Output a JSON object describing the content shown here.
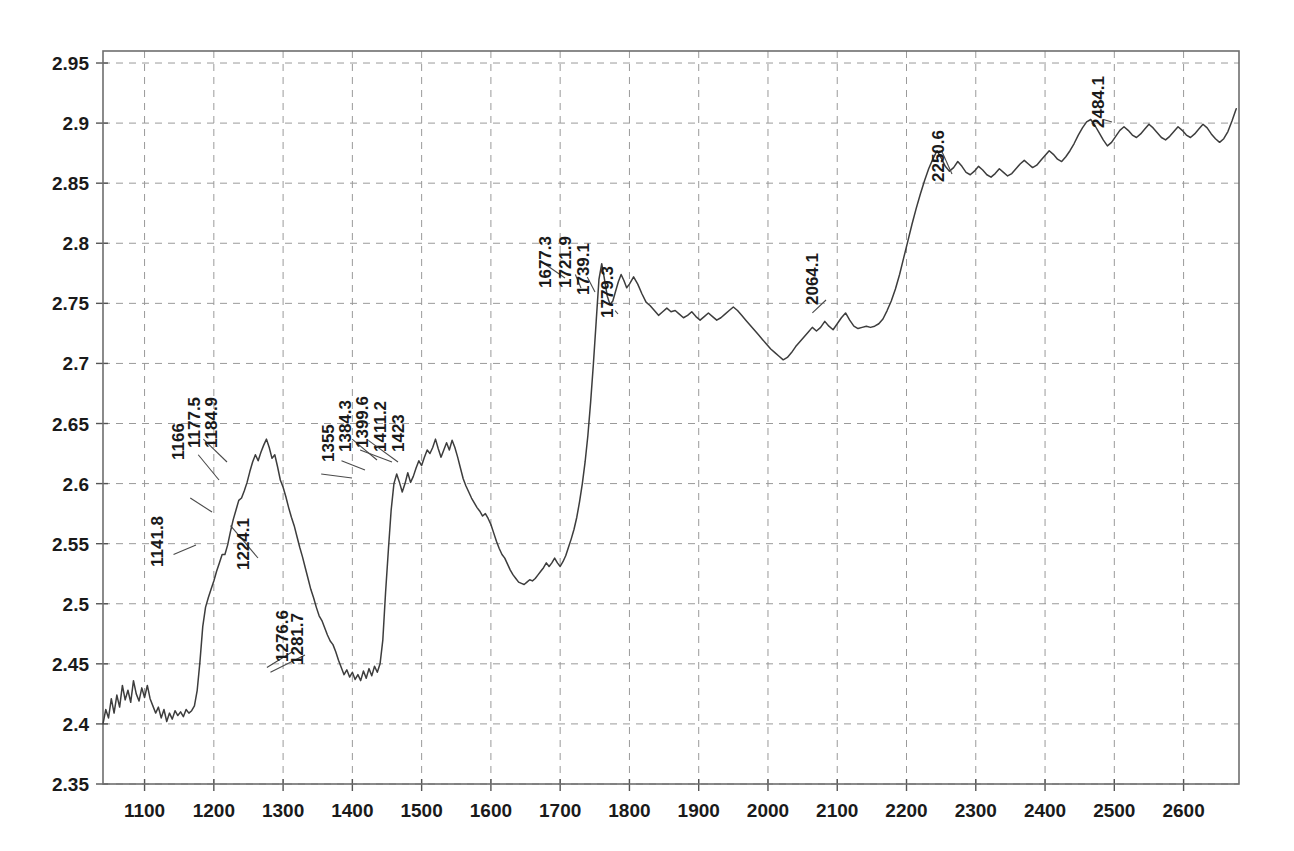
{
  "chart_data": {
    "type": "line",
    "title": "",
    "xlabel": "",
    "ylabel": "",
    "xlim": [
      1040,
      2680
    ],
    "ylim": [
      2.35,
      2.96
    ],
    "grid": true,
    "legend": null,
    "x_ticks": [
      1100,
      1200,
      1300,
      1400,
      1500,
      1600,
      1700,
      1800,
      1900,
      2000,
      2100,
      2200,
      2300,
      2400,
      2500,
      2600
    ],
    "y_ticks": [
      2.35,
      2.4,
      2.45,
      2.5,
      2.55,
      2.6,
      2.65,
      2.7,
      2.75,
      2.8,
      2.85,
      2.9,
      2.95
    ],
    "x_tick_labels": [
      "1100",
      "1200",
      "1300",
      "1400",
      "1500",
      "1600",
      "1700",
      "1800",
      "1900",
      "2000",
      "2100",
      "2200",
      "2300",
      "2400",
      "2500",
      "2600"
    ],
    "y_tick_labels": [
      "2.35",
      "2.4",
      "2.45",
      "2.5",
      "2.55",
      "2.6",
      "2.65",
      "2.7",
      "2.75",
      "2.8",
      "2.85",
      "2.9",
      "2.95"
    ],
    "line_color": "#3d3d3d",
    "grid_color": "#9a9a9a",
    "annotations": [
      {
        "label": "1141.8",
        "x": 1141.8,
        "y": 2.541
      },
      {
        "label": "1166",
        "x": 1166.0,
        "y": 2.588
      },
      {
        "label": "1177.5",
        "x": 1177.5,
        "y": 2.624
      },
      {
        "label": "1184.9",
        "x": 1184.9,
        "y": 2.637
      },
      {
        "label": "1224.1",
        "x": 1224.1,
        "y": 2.565
      },
      {
        "label": "1276.6",
        "x": 1276.6,
        "y": 2.447
      },
      {
        "label": "1281.7",
        "x": 1281.7,
        "y": 2.443
      },
      {
        "label": "1355",
        "x": 1355.0,
        "y": 2.608
      },
      {
        "label": "1384.3",
        "x": 1384.3,
        "y": 2.619
      },
      {
        "label": "1399.6",
        "x": 1399.6,
        "y": 2.637
      },
      {
        "label": "1411.2",
        "x": 1411.2,
        "y": 2.628
      },
      {
        "label": "1423",
        "x": 1423.0,
        "y": 2.636
      },
      {
        "label": "1677.3",
        "x": 1677.3,
        "y": 2.783
      },
      {
        "label": "1721.9",
        "x": 1721.9,
        "y": 2.774
      },
      {
        "label": "1739.1",
        "x": 1739.1,
        "y": 2.772
      },
      {
        "label": "1779.3",
        "x": 1779.3,
        "y": 2.744
      },
      {
        "label": "2064.1",
        "x": 2064.1,
        "y": 2.742
      },
      {
        "label": "2250.6",
        "x": 2250.6,
        "y": 2.877
      },
      {
        "label": "2484.1",
        "x": 2484.1,
        "y": 2.903
      }
    ],
    "x": [
      1040,
      1044,
      1048,
      1052,
      1056,
      1060,
      1064,
      1068,
      1072,
      1076,
      1080,
      1084,
      1088,
      1092,
      1096,
      1100,
      1104,
      1108,
      1112,
      1116,
      1120,
      1124,
      1128,
      1132,
      1136,
      1140,
      1144,
      1148,
      1152,
      1156,
      1160,
      1164,
      1168,
      1172,
      1176,
      1180,
      1184,
      1188,
      1192,
      1196,
      1200,
      1204,
      1208,
      1212,
      1216,
      1220,
      1224,
      1228,
      1232,
      1236,
      1240,
      1244,
      1248,
      1252,
      1256,
      1260,
      1264,
      1268,
      1272,
      1276,
      1280,
      1284,
      1288,
      1292,
      1296,
      1300,
      1304,
      1308,
      1312,
      1316,
      1320,
      1324,
      1328,
      1332,
      1336,
      1340,
      1344,
      1348,
      1352,
      1356,
      1360,
      1364,
      1368,
      1372,
      1376,
      1380,
      1384,
      1388,
      1392,
      1396,
      1400,
      1404,
      1408,
      1412,
      1416,
      1420,
      1424,
      1428,
      1432,
      1436,
      1440,
      1444,
      1448,
      1452,
      1456,
      1460,
      1464,
      1468,
      1472,
      1476,
      1480,
      1484,
      1488,
      1492,
      1496,
      1500,
      1504,
      1508,
      1512,
      1516,
      1520,
      1524,
      1528,
      1532,
      1536,
      1540,
      1544,
      1548,
      1552,
      1556,
      1560,
      1564,
      1568,
      1572,
      1576,
      1580,
      1584,
      1588,
      1592,
      1596,
      1600,
      1604,
      1608,
      1612,
      1616,
      1620,
      1624,
      1628,
      1632,
      1636,
      1640,
      1644,
      1648,
      1652,
      1656,
      1660,
      1664,
      1668,
      1672,
      1676,
      1680,
      1684,
      1688,
      1692,
      1696,
      1700,
      1704,
      1708,
      1712,
      1716,
      1720,
      1724,
      1728,
      1732,
      1736,
      1740,
      1744,
      1748,
      1752,
      1756,
      1760,
      1764,
      1768,
      1772,
      1776,
      1780,
      1784,
      1788,
      1792,
      1796,
      1800,
      1806,
      1812,
      1818,
      1824,
      1830,
      1836,
      1842,
      1848,
      1854,
      1860,
      1866,
      1872,
      1878,
      1884,
      1890,
      1896,
      1902,
      1908,
      1914,
      1920,
      1926,
      1932,
      1938,
      1944,
      1950,
      1956,
      1962,
      1968,
      1974,
      1980,
      1986,
      1992,
      1998,
      2004,
      2010,
      2016,
      2022,
      2028,
      2034,
      2040,
      2046,
      2052,
      2058,
      2064,
      2070,
      2076,
      2082,
      2088,
      2094,
      2100,
      2106,
      2112,
      2118,
      2124,
      2130,
      2136,
      2142,
      2148,
      2154,
      2160,
      2166,
      2172,
      2178,
      2184,
      2190,
      2196,
      2202,
      2208,
      2214,
      2220,
      2226,
      2232,
      2238,
      2244,
      2250,
      2256,
      2262,
      2268,
      2274,
      2280,
      2286,
      2292,
      2298,
      2304,
      2310,
      2316,
      2322,
      2328,
      2334,
      2340,
      2346,
      2352,
      2358,
      2364,
      2370,
      2376,
      2382,
      2388,
      2394,
      2400,
      2406,
      2412,
      2418,
      2424,
      2430,
      2436,
      2442,
      2448,
      2454,
      2460,
      2466,
      2472,
      2478,
      2484,
      2490,
      2496,
      2502,
      2508,
      2514,
      2520,
      2526,
      2532,
      2538,
      2544,
      2550,
      2556,
      2562,
      2568,
      2574,
      2580,
      2586,
      2592,
      2598,
      2604,
      2610,
      2616,
      2622,
      2628,
      2634,
      2640,
      2646,
      2652,
      2658,
      2664,
      2670,
      2676
    ],
    "y": [
      2.4,
      2.412,
      2.405,
      2.421,
      2.409,
      2.424,
      2.414,
      2.432,
      2.42,
      2.428,
      2.418,
      2.436,
      2.425,
      2.419,
      2.43,
      2.422,
      2.432,
      2.421,
      2.415,
      2.409,
      2.414,
      2.405,
      2.412,
      2.402,
      2.409,
      2.404,
      2.411,
      2.407,
      2.41,
      2.406,
      2.412,
      2.409,
      2.411,
      2.415,
      2.428,
      2.452,
      2.481,
      2.497,
      2.505,
      2.512,
      2.519,
      2.527,
      2.534,
      2.541,
      2.541,
      2.549,
      2.56,
      2.57,
      2.578,
      2.586,
      2.588,
      2.594,
      2.601,
      2.61,
      2.618,
      2.624,
      2.619,
      2.626,
      2.632,
      2.637,
      2.63,
      2.621,
      2.624,
      2.614,
      2.603,
      2.597,
      2.589,
      2.58,
      2.572,
      2.565,
      2.556,
      2.547,
      2.539,
      2.53,
      2.521,
      2.512,
      2.505,
      2.497,
      2.49,
      2.486,
      2.48,
      2.474,
      2.469,
      2.466,
      2.46,
      2.453,
      2.447,
      2.441,
      2.445,
      2.439,
      2.443,
      2.437,
      2.441,
      2.436,
      2.444,
      2.438,
      2.446,
      2.44,
      2.448,
      2.443,
      2.45,
      2.47,
      2.51,
      2.545,
      2.578,
      2.6,
      2.608,
      2.601,
      2.593,
      2.6,
      2.609,
      2.601,
      2.606,
      2.613,
      2.619,
      2.615,
      2.622,
      2.628,
      2.625,
      2.63,
      2.637,
      2.629,
      2.622,
      2.628,
      2.634,
      2.628,
      2.636,
      2.63,
      2.622,
      2.613,
      2.604,
      2.598,
      2.593,
      2.588,
      2.584,
      2.58,
      2.577,
      2.573,
      2.575,
      2.571,
      2.566,
      2.559,
      2.552,
      2.546,
      2.541,
      2.538,
      2.533,
      2.528,
      2.524,
      2.521,
      2.518,
      2.517,
      2.516,
      2.518,
      2.52,
      2.519,
      2.521,
      2.524,
      2.527,
      2.53,
      2.534,
      2.531,
      2.534,
      2.538,
      2.534,
      2.531,
      2.535,
      2.54,
      2.547,
      2.554,
      2.562,
      2.572,
      2.585,
      2.6,
      2.618,
      2.64,
      2.668,
      2.7,
      2.735,
      2.77,
      2.783,
      2.77,
      2.756,
      2.749,
      2.752,
      2.76,
      2.768,
      2.774,
      2.769,
      2.763,
      2.766,
      2.772,
      2.766,
      2.758,
      2.751,
      2.748,
      2.744,
      2.74,
      2.743,
      2.746,
      2.743,
      2.744,
      2.741,
      2.738,
      2.74,
      2.743,
      2.739,
      2.736,
      2.739,
      2.742,
      2.739,
      2.736,
      2.738,
      2.741,
      2.744,
      2.747,
      2.744,
      2.74,
      2.736,
      2.732,
      2.728,
      2.724,
      2.72,
      2.716,
      2.712,
      2.709,
      2.706,
      2.703,
      2.705,
      2.709,
      2.714,
      2.718,
      2.722,
      2.726,
      2.73,
      2.727,
      2.73,
      2.735,
      2.731,
      2.728,
      2.733,
      2.738,
      2.742,
      2.736,
      2.731,
      2.729,
      2.73,
      2.731,
      2.73,
      2.731,
      2.733,
      2.737,
      2.744,
      2.752,
      2.762,
      2.774,
      2.788,
      2.802,
      2.816,
      2.829,
      2.841,
      2.852,
      2.862,
      2.87,
      2.877,
      2.871,
      2.864,
      2.86,
      2.863,
      2.868,
      2.864,
      2.859,
      2.857,
      2.86,
      2.864,
      2.861,
      2.857,
      2.855,
      2.858,
      2.862,
      2.859,
      2.856,
      2.858,
      2.862,
      2.866,
      2.869,
      2.866,
      2.863,
      2.865,
      2.869,
      2.873,
      2.877,
      2.874,
      2.87,
      2.868,
      2.872,
      2.877,
      2.883,
      2.89,
      2.896,
      2.901,
      2.903,
      2.898,
      2.892,
      2.886,
      2.881,
      2.884,
      2.889,
      2.894,
      2.897,
      2.894,
      2.89,
      2.888,
      2.891,
      2.895,
      2.899,
      2.896,
      2.892,
      2.888,
      2.886,
      2.889,
      2.893,
      2.897,
      2.894,
      2.89,
      2.888,
      2.891,
      2.895,
      2.899,
      2.896,
      2.891,
      2.887,
      2.884,
      2.887,
      2.893,
      2.902,
      2.912,
      2.918
    ]
  }
}
